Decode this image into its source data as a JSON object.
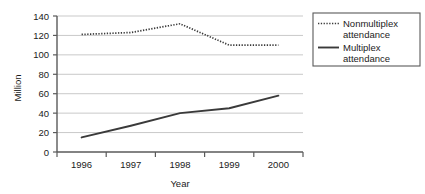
{
  "chart_data": {
    "type": "line",
    "title": "",
    "xlabel": "Year",
    "ylabel": "Million",
    "categories": [
      "1996",
      "1997",
      "1998",
      "1999",
      "2000"
    ],
    "x": [
      1996,
      1997,
      1998,
      1999,
      2000
    ],
    "ylim": [
      0,
      140
    ],
    "xlim": [
      1996,
      2000
    ],
    "yticks": [
      "0",
      "20",
      "40",
      "60",
      "80",
      "100",
      "120",
      "140"
    ],
    "ytick_values": [
      0,
      20,
      40,
      60,
      80,
      100,
      120,
      140
    ],
    "grid": "horizontal",
    "legend_position": "right",
    "series": [
      {
        "name": "Nonmultiplex attendance",
        "style": "dotted",
        "color": "#3a3a3a",
        "values": [
          121,
          123,
          132,
          110,
          110
        ]
      },
      {
        "name": "Multiplex attendance",
        "style": "solid",
        "color": "#3a3a3a",
        "values": [
          15,
          27,
          40,
          45,
          58
        ]
      }
    ]
  },
  "axes": {
    "y_title": "Million",
    "x_title": "Year"
  },
  "legend": {
    "items": [
      {
        "label_line1": "Nonmultiplex",
        "label_line2": "attendance",
        "marker": "dotted-line-swatch"
      },
      {
        "label_line1": "Multiplex",
        "label_line2": "attendance",
        "marker": "solid-line-swatch"
      }
    ]
  },
  "ticks": {
    "y": [
      "140",
      "120",
      "100",
      "80",
      "60",
      "40",
      "20",
      "0"
    ],
    "x": [
      "1996",
      "1997",
      "1998",
      "1999",
      "2000"
    ]
  },
  "colors": {
    "line": "#3a3a3a",
    "grid": "#c9c9c9",
    "axis": "#5a5a5a",
    "text": "#1b1b1b",
    "background": "#ffffff"
  }
}
